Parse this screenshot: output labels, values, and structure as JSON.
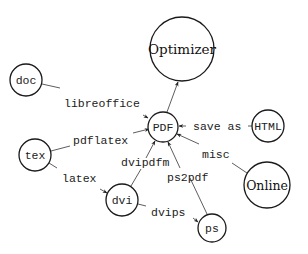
{
  "diagram": {
    "nodes": [
      {
        "id": "optimizer",
        "label": "Optimizer",
        "font": "serif",
        "cx": 182,
        "cy": 49,
        "r": 32
      },
      {
        "id": "doc",
        "label": "doc",
        "font": "mono",
        "cx": 26,
        "cy": 80,
        "r": 16
      },
      {
        "id": "pdf",
        "label": "PDF",
        "font": "mono",
        "cx": 163,
        "cy": 127,
        "r": 15
      },
      {
        "id": "html",
        "label": "HTML",
        "font": "mono",
        "cx": 268,
        "cy": 126,
        "r": 16
      },
      {
        "id": "tex",
        "label": "tex",
        "font": "mono",
        "cx": 35,
        "cy": 155,
        "r": 16
      },
      {
        "id": "online",
        "label": "Online",
        "font": "serif",
        "cx": 267,
        "cy": 185,
        "r": 23
      },
      {
        "id": "dvi",
        "label": "dvi",
        "font": "mono",
        "cx": 122,
        "cy": 200,
        "r": 16
      },
      {
        "id": "ps",
        "label": "ps",
        "font": "mono",
        "cx": 212,
        "cy": 228,
        "r": 14
      }
    ],
    "edges": [
      {
        "from": "pdf",
        "to": "optimizer",
        "label": ""
      },
      {
        "from": "doc",
        "to": "pdf",
        "label": "libreoffice"
      },
      {
        "from": "tex",
        "to": "pdf",
        "label": "pdflatex"
      },
      {
        "from": "html",
        "to": "pdf",
        "label": "save as"
      },
      {
        "from": "online",
        "to": "pdf",
        "label": "misc"
      },
      {
        "from": "tex",
        "to": "dvi",
        "label": "latex"
      },
      {
        "from": "dvi",
        "to": "pdf",
        "label": "dvipdfm"
      },
      {
        "from": "dvi",
        "to": "ps",
        "label": "dvips"
      },
      {
        "from": "ps",
        "to": "pdf",
        "label": "ps2pdf"
      }
    ],
    "labels": {
      "optimizer": "Optimizer",
      "doc": "doc",
      "pdf": "PDF",
      "html": "HTML",
      "tex": "tex",
      "online": "Online",
      "dvi": "dvi",
      "ps": "ps",
      "libreoffice": "libreoffice",
      "pdflatex": "pdflatex",
      "save_as": "save as",
      "misc": "misc",
      "latex": "latex",
      "dvipdfm": "dvipdfm",
      "dvips": "dvips",
      "ps2pdf": "ps2pdf"
    }
  }
}
